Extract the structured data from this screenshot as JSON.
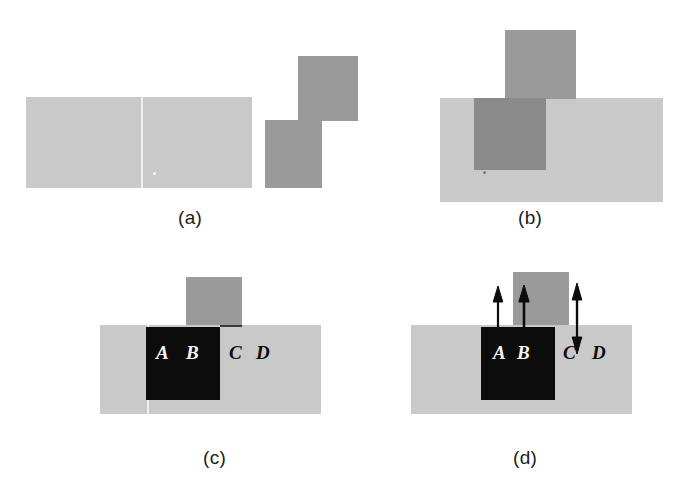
{
  "figure": {
    "background_color": "#ffffff",
    "width": 691,
    "height": 484
  },
  "colors": {
    "light_gray": "#c9c9c9",
    "mid_gray": "#9a9a9a",
    "overlap_gray": "#8a8a8a",
    "black": "#0c0c0c",
    "white_label": "#f4f4f4",
    "caption_text": "#1c1c1c"
  },
  "panels": [
    {
      "id": "a",
      "caption": "(a)",
      "caption_x": 178,
      "caption_y": 207,
      "description": "A wide light-gray rectangle on the left and a separate darker gray staircase (two offset squares) on the right, shown apart.",
      "shapes": [
        {
          "name": "light-background-rect",
          "tone": "light_gray",
          "x": 26,
          "y": 97,
          "w": 226,
          "h": 91
        },
        {
          "name": "dark-lower-square",
          "tone": "mid_gray",
          "x": 265,
          "y": 120,
          "w": 57,
          "h": 68
        },
        {
          "name": "dark-upper-square",
          "tone": "mid_gray",
          "x": 298,
          "y": 56,
          "w": 60,
          "h": 65
        }
      ],
      "labels": []
    },
    {
      "id": "b",
      "caption": "(b)",
      "caption_x": 518,
      "caption_y": 207,
      "description": "Same two figures now superimposed: the dark staircase overlaps the light rectangle, making a darker intersection region.",
      "shapes": [
        {
          "name": "light-background-rect",
          "tone": "light_gray",
          "x": 440,
          "y": 98,
          "w": 223,
          "h": 104
        },
        {
          "name": "dark-lower-square",
          "tone": "mid_gray",
          "x": 474,
          "y": 98,
          "w": 72,
          "h": 72
        },
        {
          "name": "dark-upper-square",
          "tone": "mid_gray",
          "x": 505,
          "y": 30,
          "w": 71,
          "h": 69
        },
        {
          "name": "overlap-region",
          "tone": "overlap_gray",
          "x": 474,
          "y": 98,
          "w": 72,
          "h": 72
        }
      ],
      "labels": []
    },
    {
      "id": "c",
      "caption": "(c)",
      "caption_x": 203,
      "caption_y": 447,
      "description": "The occluding configuration with a black square pasted over part of the scene; four italic point labels A, B, C, D sit along one horizontal line.",
      "shapes": [
        {
          "name": "light-background-rect",
          "tone": "light_gray",
          "x": 100,
          "y": 325,
          "w": 221,
          "h": 89
        },
        {
          "name": "vertical-gray-bar",
          "tone": "mid_gray",
          "x": 186,
          "y": 277,
          "w": 56,
          "h": 55
        },
        {
          "name": "black-occluder-square",
          "tone": "black",
          "x": 146,
          "y": 327,
          "w": 74,
          "h": 73
        }
      ],
      "labels": [
        {
          "text": "A",
          "x": 156,
          "y": 350,
          "style": "light"
        },
        {
          "text": "B",
          "x": 186,
          "y": 350,
          "style": "light"
        },
        {
          "text": "C",
          "x": 229,
          "y": 350,
          "style": "dark"
        },
        {
          "text": "D",
          "x": 256,
          "y": 350,
          "style": "dark"
        }
      ],
      "arrows": []
    },
    {
      "id": "d",
      "caption": "(d)",
      "caption_x": 513,
      "caption_y": 447,
      "description": "Same configuration as (c) with motion arrows: upward arrows at A, B and C, and a downward arrow between C and D indicating opposite displacement.",
      "shapes": [
        {
          "name": "light-background-rect",
          "tone": "light_gray",
          "x": 411,
          "y": 325,
          "w": 221,
          "h": 89
        },
        {
          "name": "vertical-gray-bar",
          "tone": "mid_gray",
          "x": 513,
          "y": 272,
          "w": 56,
          "h": 60
        },
        {
          "name": "black-occluder-square",
          "tone": "black",
          "x": 481,
          "y": 327,
          "w": 74,
          "h": 73
        }
      ],
      "labels": [
        {
          "text": "A",
          "x": 493,
          "y": 350,
          "style": "light"
        },
        {
          "text": "B",
          "x": 517,
          "y": 350,
          "style": "light"
        },
        {
          "text": "C",
          "x": 563,
          "y": 350,
          "style": "dark"
        },
        {
          "text": "D",
          "x": 592,
          "y": 350,
          "style": "dark"
        }
      ],
      "arrows": [
        {
          "name": "arrow-up-at-a",
          "direction": "up",
          "x": 498,
          "y_tail": 330,
          "y_head": 295
        },
        {
          "name": "arrow-up-at-b",
          "direction": "up",
          "x": 524,
          "y_tail": 330,
          "y_head": 295
        },
        {
          "name": "arrow-up-at-c",
          "direction": "up",
          "x": 577,
          "y_tail": 330,
          "y_head": 293
        },
        {
          "name": "arrow-down-at-c",
          "direction": "down",
          "x": 577,
          "y_tail": 300,
          "y_head": 352
        }
      ]
    }
  ]
}
